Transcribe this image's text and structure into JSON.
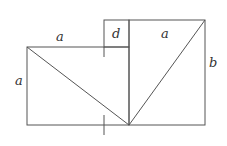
{
  "diagram": {
    "labels": {
      "top_left_a": "a",
      "d": "d",
      "top_right_a": "a",
      "left_a": "a",
      "right_b": "b"
    },
    "colors": {
      "line": "#555555",
      "text": "#333333",
      "background": "#ffffff"
    }
  }
}
